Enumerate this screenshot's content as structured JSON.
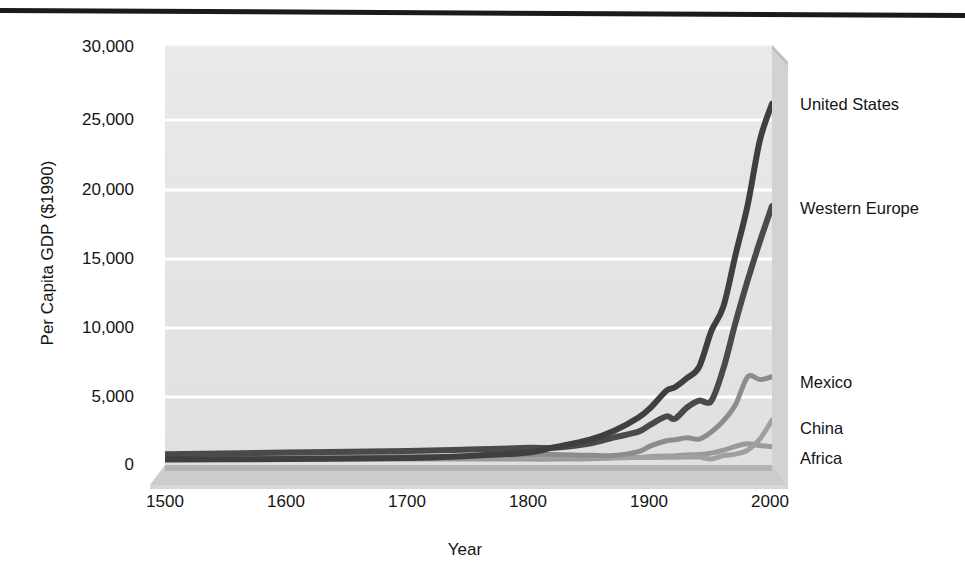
{
  "figure": {
    "background_color": "#ffffff",
    "plot_background_color": "#e6e6e6",
    "gridline_color": "#ffffff",
    "top_rule_color": "#1a1a1a"
  },
  "axes": {
    "y_title": "Per Capita GDP ($1990)",
    "x_title": "Year",
    "y_ticks": [
      "0",
      "5,000",
      "10,000",
      "15,000",
      "20,000",
      "25,000",
      "30,000"
    ],
    "x_ticks": [
      "1500",
      "1600",
      "1700",
      "1800",
      "1900",
      "2000"
    ]
  },
  "series_labels": {
    "united_states": "United States",
    "western_europe": "Western Europe",
    "mexico": "Mexico",
    "china": "China",
    "africa": "Africa"
  },
  "chart_data": {
    "type": "line",
    "title": "",
    "subtitle": "",
    "xlabel": "Year",
    "ylabel": "Per Capita GDP ($1990)",
    "xlim": [
      1500,
      2000
    ],
    "ylim": [
      0,
      30000
    ],
    "x_tick_values": [
      1500,
      1600,
      1700,
      1800,
      1900,
      2000
    ],
    "y_tick_values": [
      0,
      5000,
      10000,
      15000,
      20000,
      25000,
      30000
    ],
    "grid": "horizontal",
    "legend_position": "right-inline-labels",
    "x": [
      1500,
      1600,
      1700,
      1750,
      1800,
      1820,
      1850,
      1870,
      1890,
      1900,
      1913,
      1920,
      1930,
      1940,
      1950,
      1960,
      1970,
      1980,
      1990,
      2000
    ],
    "series": [
      {
        "name": "United States",
        "color": "#3f3f3f",
        "label_value": 25800,
        "values": [
          400,
          420,
          500,
          650,
          900,
          1257,
          1806,
          2445,
          3392,
          4091,
          5301,
          5552,
          6213,
          7010,
          9561,
          11328,
          15030,
          18577,
          23201,
          25800
        ]
      },
      {
        "name": "Western Europe",
        "color": "#4a4a4a",
        "label_value": 18500,
        "values": [
          771,
          889,
          997,
          1100,
          1232,
          1232,
          1535,
          1974,
          2380,
          2885,
          3473,
          3300,
          4110,
          4600,
          4579,
          6900,
          10195,
          13197,
          15966,
          18500
        ]
      },
      {
        "name": "Mexico",
        "color": "#8c8c8c",
        "label_value": 6300,
        "values": [
          425,
          454,
          568,
          600,
          759,
          759,
          690,
          674,
          950,
          1366,
          1732,
          1800,
          1940,
          1850,
          2365,
          3155,
          4320,
          6300,
          6100,
          6300
        ]
      },
      {
        "name": "China",
        "color": "#a0a0a0",
        "label_value": 3200,
        "values": [
          600,
          600,
          600,
          600,
          600,
          600,
          600,
          530,
          540,
          545,
          552,
          550,
          568,
          562,
          439,
          673,
          778,
          1061,
          1858,
          3200
        ]
      },
      {
        "name": "Africa",
        "color": "#9a9a9a",
        "label_value": 1300,
        "values": [
          414,
          422,
          421,
          430,
          420,
          420,
          440,
          500,
          550,
          601,
          637,
          650,
          720,
          760,
          852,
          1055,
          1335,
          1515,
          1385,
          1300
        ]
      }
    ]
  }
}
